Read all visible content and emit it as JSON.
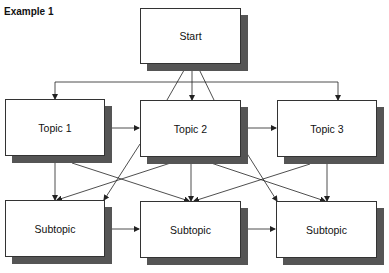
{
  "title": "Example 1",
  "colors": {
    "shadow": "#555555",
    "border": "#333333",
    "line": "#222222",
    "background": "#ffffff"
  },
  "nodes": {
    "start": {
      "label": "Start",
      "x": 140,
      "y": 8,
      "w": 101,
      "h": 56
    },
    "topic1": {
      "label": "Topic 1",
      "x": 5,
      "y": 99,
      "w": 100,
      "h": 57
    },
    "topic2": {
      "label": "Topic 2",
      "x": 140,
      "y": 100,
      "w": 101,
      "h": 57
    },
    "topic3": {
      "label": "Topic 3",
      "x": 277,
      "y": 100,
      "w": 100,
      "h": 57
    },
    "subtopic1": {
      "label": "Subtopic",
      "x": 5,
      "y": 200,
      "w": 100,
      "h": 57
    },
    "subtopic2": {
      "label": "Subtopic",
      "x": 140,
      "y": 201,
      "w": 101,
      "h": 57
    },
    "subtopic3": {
      "label": "Subtopic",
      "x": 276,
      "y": 201,
      "w": 101,
      "h": 57
    }
  },
  "edges": [
    {
      "from": "start",
      "to": "topic1",
      "type": "arrow"
    },
    {
      "from": "start",
      "to": "topic2",
      "type": "arrow"
    },
    {
      "from": "start",
      "to": "topic3",
      "type": "arrow"
    },
    {
      "from": "topic2",
      "to": "start",
      "type": "arrow"
    },
    {
      "from": "topic2",
      "to": "start",
      "type": "arrow"
    },
    {
      "from": "topic1",
      "to": "topic2",
      "type": "bidirectional"
    },
    {
      "from": "topic2",
      "to": "topic3",
      "type": "bidirectional"
    },
    {
      "from": "topic1",
      "to": "subtopic1",
      "type": "arrow"
    },
    {
      "from": "topic1",
      "to": "subtopic2",
      "type": "arrow"
    },
    {
      "from": "topic2",
      "to": "subtopic1",
      "type": "arrow"
    },
    {
      "from": "topic2",
      "to": "subtopic2",
      "type": "arrow"
    },
    {
      "from": "topic2",
      "to": "subtopic3",
      "type": "arrow"
    },
    {
      "from": "topic3",
      "to": "subtopic2",
      "type": "arrow"
    },
    {
      "from": "topic3",
      "to": "subtopic3",
      "type": "arrow"
    },
    {
      "from": "subtopic1",
      "to": "subtopic2",
      "type": "bidirectional"
    },
    {
      "from": "subtopic2",
      "to": "subtopic3",
      "type": "bidirectional"
    }
  ]
}
